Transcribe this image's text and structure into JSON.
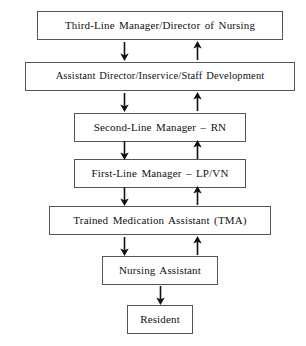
{
  "diagram": {
    "type": "hierarchy-flowchart",
    "colors": {
      "background": "#ffffff",
      "box_border": "#555555",
      "box_fill": "#ffffff",
      "text": "#111111",
      "arrow": "#111111"
    },
    "nodes": [
      {
        "id": "third-line-manager",
        "label": "Third-Line Manager/Director of Nursing",
        "level": 1,
        "x": 23,
        "y": 11,
        "width": 246,
        "height": 29
      },
      {
        "id": "assistant-director",
        "label": "Assistant Director/Inservice/Staff Development",
        "level": 2,
        "x": 11,
        "y": 62,
        "width": 270,
        "height": 29
      },
      {
        "id": "second-line-manager",
        "label": "Second-Line Manager – RN",
        "level": 3,
        "x": 60,
        "y": 113,
        "width": 172,
        "height": 29
      },
      {
        "id": "first-line-manager",
        "label": "First-Line Manager – LP/VN",
        "level": 4,
        "x": 60,
        "y": 159,
        "width": 172,
        "height": 29
      },
      {
        "id": "trained-medication-assistant",
        "label": "Trained Medication Assistant (TMA)",
        "level": 5,
        "x": 35,
        "y": 206,
        "width": 222,
        "height": 29
      },
      {
        "id": "nursing-assistant",
        "label": "Nursing Assistant",
        "level": 6,
        "x": 88,
        "y": 256,
        "width": 116,
        "height": 29
      },
      {
        "id": "resident",
        "label": "Resident",
        "level": 7,
        "x": 113,
        "y": 305,
        "width": 66,
        "height": 29
      }
    ],
    "connectors": [
      {
        "id": "connector-level-1-2",
        "from": "third-line-manager",
        "to": "assistant-director",
        "down_arrow": {
          "x": 104,
          "y": 41
        },
        "up_arrow": {
          "x": 177,
          "y": 41
        }
      },
      {
        "id": "connector-level-2-3",
        "from": "assistant-director",
        "to": "second-line-manager",
        "down_arrow": {
          "x": 104,
          "y": 92
        },
        "up_arrow": {
          "x": 177,
          "y": 92
        }
      },
      {
        "id": "connector-level-3-4",
        "from": "second-line-manager",
        "to": "first-line-manager",
        "down_arrow": {
          "x": 104,
          "y": 140
        },
        "up_arrow": {
          "x": 177,
          "y": 140
        }
      },
      {
        "id": "connector-level-4-5",
        "from": "first-line-manager",
        "to": "trained-medication-assistant",
        "down_arrow": {
          "x": 104,
          "y": 186
        },
        "up_arrow": {
          "x": 177,
          "y": 186
        }
      },
      {
        "id": "connector-level-5-6",
        "from": "trained-medication-assistant",
        "to": "nursing-assistant",
        "down_arrow": {
          "x": 104,
          "y": 236
        },
        "up_arrow": {
          "x": 177,
          "y": 236
        }
      },
      {
        "id": "connector-level-6-7",
        "from": "nursing-assistant",
        "to": "resident",
        "down_arrow": {
          "x": 140,
          "y": 285
        },
        "up_arrow": null
      }
    ]
  }
}
